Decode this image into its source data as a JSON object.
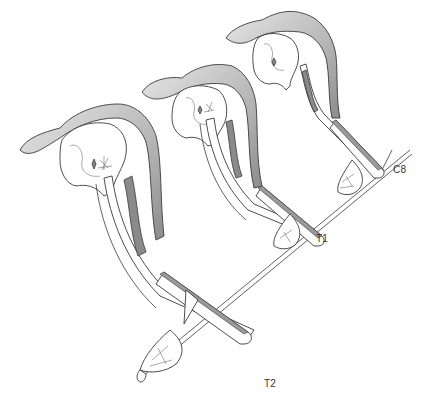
{
  "figure": {
    "style": "grayscale line illustration"
  },
  "labels": [
    {
      "id": "c8",
      "text": "C8"
    },
    {
      "id": "t1",
      "text": "T1"
    },
    {
      "id": "t2",
      "text": "T2"
    }
  ],
  "colors": {
    "background": "#ffffff",
    "outline": "#3a3a3a",
    "shading": "#8a8a8a",
    "label": "#333333"
  }
}
